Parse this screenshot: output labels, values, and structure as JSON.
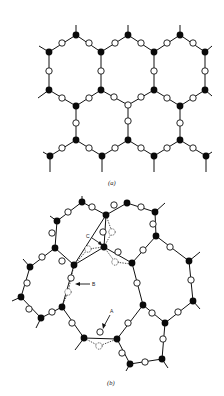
{
  "figure": {
    "panel_a": {
      "label": "(a)",
      "description": "Ordered hexagonal network: black tetrahedral atoms bridged by open-circle atoms"
    },
    "panel_b": {
      "label": "(b)",
      "description": "Disordered random network with defects",
      "annotations": [
        {
          "id": "A",
          "text": "A"
        },
        {
          "id": "B",
          "text": "B"
        },
        {
          "id": "C",
          "text": "C"
        }
      ]
    },
    "legend": {
      "filled_circle": "network-forming atom",
      "open_circle": "bridging atom",
      "dashed_circle": "alternative/defect position"
    },
    "colors": {
      "ink": "#111111",
      "background": "#ffffff"
    }
  }
}
